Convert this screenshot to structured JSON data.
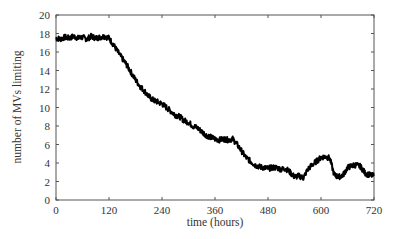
{
  "chart_data": {
    "type": "line",
    "title": "",
    "xlabel": "time (hours)",
    "ylabel": "number of MVs limiting",
    "xlim": [
      0,
      720
    ],
    "ylim": [
      0,
      20
    ],
    "xticks": [
      0,
      120,
      240,
      360,
      480,
      600,
      720
    ],
    "yticks": [
      0,
      2,
      4,
      6,
      8,
      10,
      12,
      14,
      16,
      18,
      20
    ],
    "grid": false,
    "legend": null,
    "series": [
      {
        "name": "MVs limiting",
        "color": "#000000",
        "x": [
          0,
          10,
          20,
          30,
          40,
          50,
          60,
          70,
          80,
          90,
          100,
          110,
          120,
          130,
          140,
          150,
          160,
          170,
          180,
          190,
          200,
          210,
          220,
          230,
          240,
          250,
          260,
          270,
          280,
          290,
          300,
          310,
          320,
          330,
          340,
          350,
          360,
          370,
          380,
          390,
          400,
          410,
          420,
          430,
          440,
          450,
          460,
          470,
          480,
          490,
          500,
          510,
          520,
          530,
          540,
          550,
          560,
          570,
          580,
          590,
          600,
          610,
          620,
          630,
          640,
          650,
          660,
          670,
          680,
          690,
          700,
          710,
          720
        ],
        "y": [
          17.5,
          17.4,
          17.6,
          17.5,
          17.7,
          17.5,
          17.6,
          17.4,
          17.7,
          17.5,
          17.6,
          17.7,
          17.5,
          16.8,
          16.0,
          15.3,
          14.6,
          13.8,
          13.0,
          12.3,
          11.8,
          11.2,
          10.8,
          10.6,
          10.4,
          10.0,
          9.6,
          9.2,
          9.0,
          8.6,
          8.4,
          8.0,
          7.8,
          7.4,
          7.0,
          6.8,
          6.6,
          6.5,
          6.6,
          6.5,
          6.6,
          6.0,
          5.3,
          4.6,
          4.2,
          3.8,
          3.6,
          3.5,
          3.4,
          3.5,
          3.5,
          3.3,
          3.4,
          3.0,
          2.5,
          2.6,
          2.4,
          3.3,
          3.8,
          4.2,
          4.6,
          4.7,
          4.5,
          2.7,
          2.5,
          2.7,
          3.5,
          3.7,
          3.8,
          3.6,
          2.9,
          2.7,
          2.6
        ]
      }
    ]
  }
}
